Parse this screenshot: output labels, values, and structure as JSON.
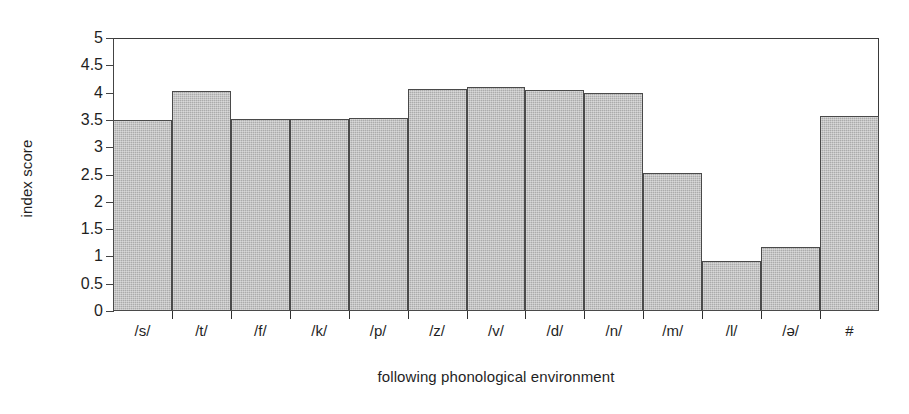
{
  "chart_data": {
    "type": "bar",
    "title": "",
    "subtitle": "",
    "xlabel": "following phonological environment",
    "ylabel": "index score",
    "ylim": [
      0,
      5
    ],
    "ytick_labels": [
      "0",
      "0.5",
      "1",
      "1.5",
      "2",
      "2.5",
      "3",
      "3.5",
      "4",
      "4.5",
      "5"
    ],
    "ytick_values": [
      0,
      0.5,
      1,
      1.5,
      2,
      2.5,
      3,
      3.5,
      4,
      4.5,
      5
    ],
    "grid": false,
    "legend": "none",
    "bar_gap": 0,
    "categories": [
      "/s/",
      "/t/",
      "/f/",
      "/k/",
      "/p/",
      "/z/",
      "/v/",
      "/d/",
      "/n/",
      "/m/",
      "/l/",
      "/ə/",
      "#"
    ],
    "values": [
      3.5,
      4.03,
      3.51,
      3.51,
      3.53,
      4.07,
      4.11,
      4.04,
      4.0,
      2.53,
      0.92,
      1.18,
      3.57
    ],
    "series": [
      {
        "name": "index score",
        "color": "#ababab",
        "edge_color": "#4a4a4a",
        "values": [
          3.5,
          4.03,
          3.51,
          3.51,
          3.53,
          4.07,
          4.11,
          4.04,
          4.0,
          2.53,
          0.92,
          1.18,
          3.57
        ]
      }
    ]
  },
  "axes": {
    "y_title": "index score",
    "x_title": "following phonological environment"
  },
  "colors": {
    "bar_fill": "#ababab",
    "bar_edge": "#4a4a4a",
    "axis": "#2f2f2f",
    "text": "#1f1f1f",
    "background": "#ffffff"
  }
}
